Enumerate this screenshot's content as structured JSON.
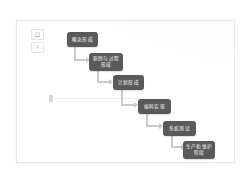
{
  "canvas": {
    "background_color": "#ffffff",
    "border_color": "#e8e8e8"
  },
  "corner_label": {
    "name": "corner-label",
    "lines": [
      "口",
      "I"
    ]
  },
  "guide": {
    "handle_name": "guide-handle",
    "line_color": "#ededed"
  },
  "diagram": {
    "type": "flowchart-cascade",
    "node_color": "#5a5a5a",
    "connector_color": "#c9c9c9",
    "nodes": [
      {
        "id": "n1",
        "label": "概念形成"
      },
      {
        "id": "n2",
        "label": "原则与过程形成"
      },
      {
        "id": "n3",
        "label": "计划形成"
      },
      {
        "id": "n4",
        "label": "编码实现"
      },
      {
        "id": "n5",
        "label": "系统测试"
      },
      {
        "id": "n6",
        "label": "生产和维护阶段"
      }
    ],
    "connectors": [
      {
        "from": "n1",
        "to": "n2"
      },
      {
        "from": "n2",
        "to": "n3"
      },
      {
        "from": "n3",
        "to": "n4"
      },
      {
        "from": "n4",
        "to": "n5"
      },
      {
        "from": "n5",
        "to": "n6"
      }
    ]
  }
}
